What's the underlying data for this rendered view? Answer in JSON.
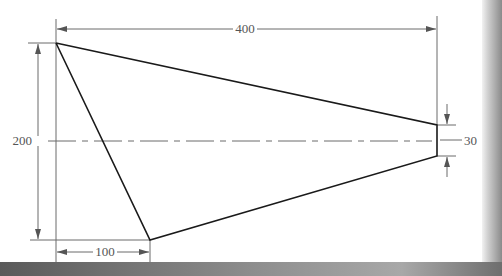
{
  "diagram": {
    "type": "engineering-dimension-drawing",
    "shape": "trapezoidal-plate",
    "dimensions": {
      "overall_length": "400",
      "height": "200",
      "bottom_offset": "100",
      "tip_width": "30"
    },
    "colors": {
      "outline": "#1a1a1a",
      "dimension_lines": "#6b6b6b",
      "background": "#ffffff"
    }
  }
}
